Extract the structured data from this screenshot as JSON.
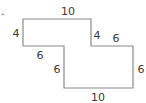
{
  "figure": {
    "type": "composite-rectilinear-shape",
    "marker": ".",
    "outline_color": "#8a8a8a",
    "label_color": "#3a3a3a",
    "vertices": [
      [
        23,
        19
      ],
      [
        91,
        19
      ],
      [
        91,
        46
      ],
      [
        133,
        46
      ],
      [
        133,
        88
      ],
      [
        64,
        88
      ],
      [
        64,
        46
      ],
      [
        23,
        46
      ]
    ],
    "labels": {
      "top": "10",
      "left": "4",
      "upper_step_vertical": "4",
      "upper_step_horizontal": "6",
      "lower_step_horizontal": "6",
      "lower_step_vertical": "6",
      "right": "6",
      "bottom": "10"
    }
  }
}
